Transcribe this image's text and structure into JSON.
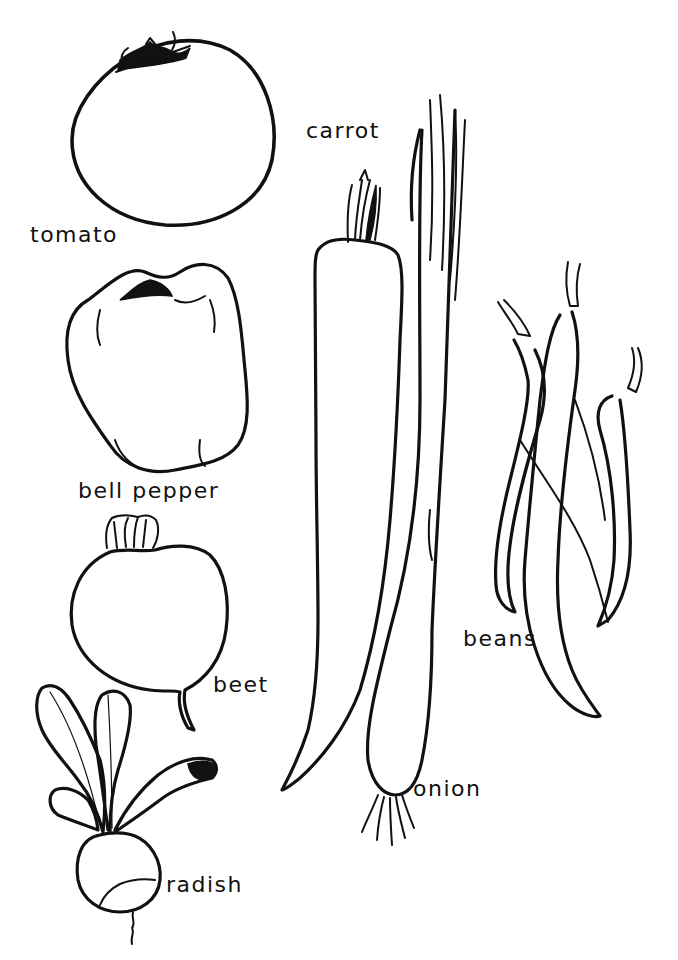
{
  "colors": {
    "ink": "#111111",
    "paper": "#ffffff"
  },
  "labels": {
    "tomato": "tomato",
    "bell_pepper": "bell pepper",
    "beet": "beet",
    "radish": "radish",
    "carrot": "carrot",
    "onion": "onion",
    "beans": "beans"
  },
  "vegetables": [
    {
      "id": "tomato",
      "label": "tomato"
    },
    {
      "id": "bell-pepper",
      "label": "bell pepper"
    },
    {
      "id": "beet",
      "label": "beet"
    },
    {
      "id": "radish",
      "label": "radish"
    },
    {
      "id": "carrot",
      "label": "carrot"
    },
    {
      "id": "onion",
      "label": "onion"
    },
    {
      "id": "beans",
      "label": "beans"
    }
  ]
}
